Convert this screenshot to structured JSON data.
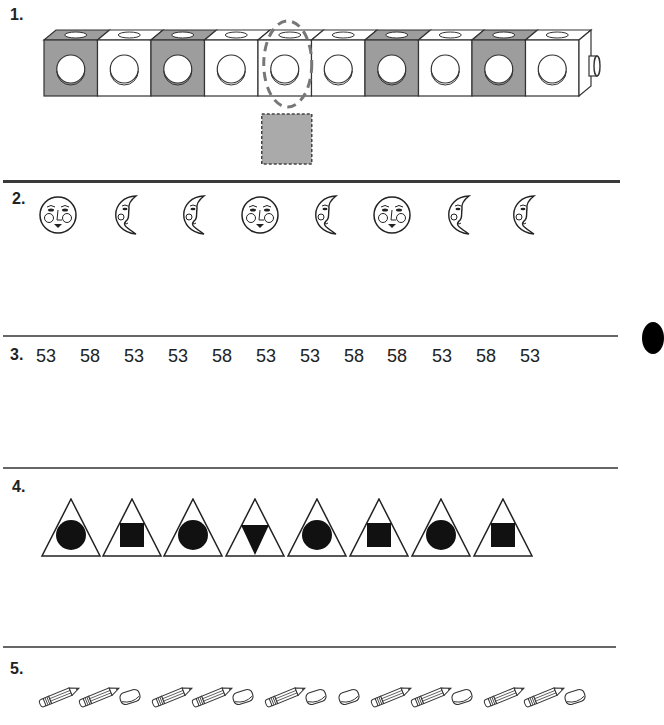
{
  "problems": [
    {
      "number": "1.",
      "kind": "cube-train",
      "cubes": [
        "gray",
        "white",
        "gray",
        "white",
        "white",
        "white",
        "gray",
        "white",
        "gray",
        "white"
      ],
      "circled_index": 4,
      "answer_box": {
        "fill": "#aaaaaa",
        "style": "dashed"
      }
    },
    {
      "number": "2.",
      "kind": "faces",
      "items": [
        "sun",
        "moon",
        "moon",
        "sun",
        "moon",
        "sun",
        "moon",
        "moon"
      ]
    },
    {
      "number": "3.",
      "kind": "numbers",
      "items": [
        "53",
        "58",
        "53",
        "53",
        "58",
        "53",
        "53",
        "58",
        "58",
        "53",
        "58",
        "53"
      ]
    },
    {
      "number": "4.",
      "kind": "triangles",
      "items": [
        "circle",
        "square",
        "circle",
        "inverted-triangle",
        "circle",
        "square",
        "circle",
        "square"
      ]
    },
    {
      "number": "5.",
      "kind": "supplies",
      "items": [
        "pencil",
        "pencil",
        "eraser",
        "pencil",
        "pencil",
        "eraser",
        "pencil",
        "eraser",
        "eraser",
        "pencil",
        "pencil",
        "eraser",
        "pencil",
        "pencil",
        "eraser"
      ]
    }
  ],
  "colors": {
    "cube_gray": "#9d9d9d",
    "cube_white": "#ffffff",
    "line": "#333333",
    "dashed": "#777777"
  }
}
